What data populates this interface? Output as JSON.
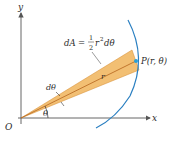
{
  "figure": {
    "type": "polar-area-element",
    "axes": {
      "x_label": "x",
      "y_label": "y",
      "origin_label": "O"
    },
    "labels": {
      "area_formula_lhs": "dA",
      "area_formula_eq": "=",
      "area_formula_num": "1",
      "area_formula_den": "2",
      "area_formula_rhs": "r",
      "area_formula_exp": "2",
      "area_formula_tail": "dθ",
      "point": "P(r, θ)",
      "radius": "r",
      "d_theta": "dθ",
      "theta": "θ"
    },
    "colors": {
      "sector_fill": "#f0b45a",
      "sector_edge": "#d4892a",
      "radius_line": "#b5651d",
      "curve": "#2a7fc1",
      "point": "#2a9fd6",
      "axis": "#555555",
      "text": "#2a2a2a"
    }
  }
}
